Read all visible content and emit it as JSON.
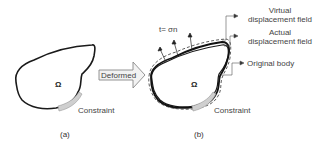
{
  "figure": {
    "panel_a": {
      "caption": "(a)",
      "domain_symbol": "Ω",
      "constraint_label": "Constraint"
    },
    "arrow": {
      "label": "Deformed"
    },
    "panel_b": {
      "caption": "(b)",
      "domain_symbol": "Ω",
      "constraint_label": "Constraint",
      "traction_label": "t= σn",
      "legend": [
        {
          "line1": "Virtual",
          "line2": "displacement field"
        },
        {
          "line1": "Actual",
          "line2": "displacement field"
        },
        {
          "line1": "Original body",
          "line2": ""
        }
      ]
    },
    "colors": {
      "outline": "#1a1a1a",
      "constraint_fill": "#cfcfcf",
      "arrow_fill": "#f2f2f2",
      "arrow_stroke": "#888888"
    }
  }
}
